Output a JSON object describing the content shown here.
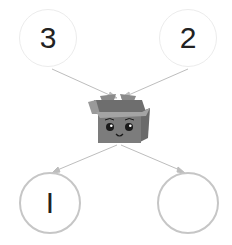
{
  "diagram": {
    "type": "number-bond",
    "inputs": [
      {
        "id": "top-left",
        "value": "3"
      },
      {
        "id": "top-right",
        "value": "2"
      }
    ],
    "machine": {
      "label": "",
      "icon": "smiling-box-icon"
    },
    "outputs": [
      {
        "id": "bottom-left",
        "value": "I"
      },
      {
        "id": "bottom-right",
        "value": ""
      }
    ],
    "colors": {
      "top_border": "#ececec",
      "bottom_border": "#c6c6c6",
      "link": "#bdbdbd",
      "box_body": "#7c7c7c",
      "box_flap": "#9a9a9a",
      "text": "#222222"
    }
  }
}
